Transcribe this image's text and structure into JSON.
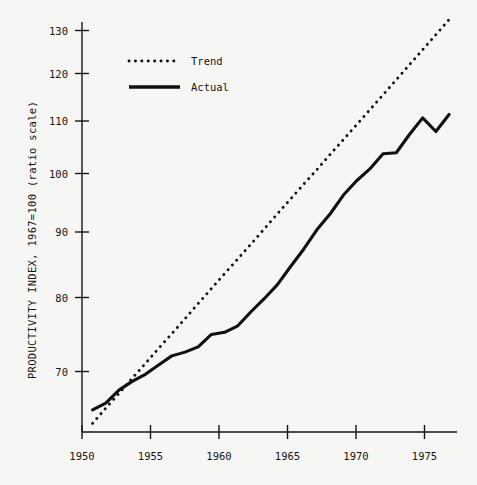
{
  "chart_data": {
    "type": "line",
    "title": "",
    "xlabel": "",
    "ylabel": "PRODUCTIVITY INDEX, 1967=100 (ratio scale)",
    "yscale": "log",
    "xlim": [
      1949.2,
      1977.6
    ],
    "ylim": [
      61.0,
      132.0
    ],
    "grid": false,
    "legend_position": "upper-left",
    "xticks": [
      1950,
      1955,
      1960,
      1965,
      1970,
      1975
    ],
    "xtick_labels": [
      "1950",
      "1955",
      "1960",
      "1965",
      "1970",
      "1975"
    ],
    "yticks": [
      70,
      80,
      90,
      100,
      110,
      120,
      130
    ],
    "ytick_labels": [
      "70",
      "80",
      "90",
      "100",
      "110",
      "120",
      "130"
    ],
    "x": [
      1950,
      1951,
      1952,
      1953,
      1954,
      1955,
      1956,
      1957,
      1958,
      1959,
      1960,
      1961,
      1962,
      1963,
      1964,
      1965,
      1966,
      1967,
      1968,
      1969,
      1970,
      1971,
      1972,
      1973,
      1974,
      1975,
      1976,
      1977
    ],
    "series": [
      {
        "name": "Trend",
        "style": "dotted",
        "color": "#101010",
        "values": [
          62.0,
          63.8,
          65.6,
          67.5,
          69.4,
          71.4,
          73.4,
          75.5,
          77.7,
          79.9,
          82.2,
          84.5,
          86.9,
          89.4,
          92.0,
          94.6,
          97.3,
          100.0,
          102.9,
          105.8,
          108.8,
          111.9,
          115.1,
          118.4,
          121.8,
          125.3,
          128.9,
          132.6
        ]
      },
      {
        "name": "Actual",
        "style": "solid",
        "color": "#101010",
        "values": [
          63.6,
          64.4,
          66.0,
          67.1,
          68.0,
          69.2,
          70.4,
          70.9,
          71.6,
          73.3,
          73.6,
          74.5,
          76.5,
          78.4,
          80.5,
          83.3,
          86.1,
          89.3,
          92.0,
          95.3,
          97.9,
          100.1,
          103.0,
          103.2,
          106.8,
          110.2,
          107.4,
          110.9
        ]
      }
    ],
    "legend": [
      {
        "label": "Trend",
        "style": "dotted"
      },
      {
        "label": "Actual",
        "style": "solid"
      }
    ]
  },
  "colors": {
    "background": "#f6f6f4",
    "ink": "#101010"
  }
}
